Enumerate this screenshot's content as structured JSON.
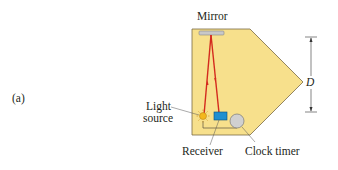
{
  "figure": {
    "panel_label": "(a)",
    "labels": {
      "mirror": "Mirror",
      "light_source_line1": "Light",
      "light_source_line2": "source",
      "receiver": "Receiver",
      "clock_timer": "Clock timer",
      "distance": "D"
    },
    "colors": {
      "body_fill": "#f7e08c",
      "body_stroke": "#7a6a45",
      "beam": "#d42a1e",
      "receiver": "#1f8fd0",
      "mirror": "#c8c8c8",
      "clock": "#d0d0d0",
      "light_source": "#f3b71c"
    }
  }
}
